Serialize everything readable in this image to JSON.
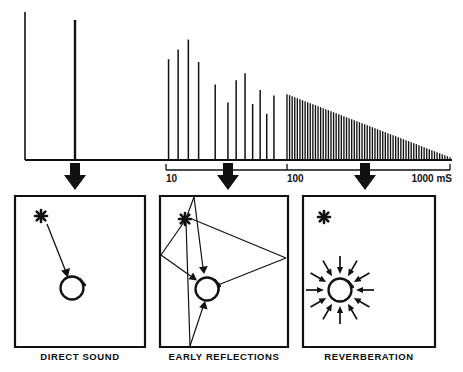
{
  "figure": {
    "background_color": "#ffffff",
    "ink_color": "#111111"
  },
  "chart_data": {
    "type": "bar",
    "title": "",
    "xlabel": "",
    "ylabel": "",
    "x_scale": "log",
    "x_unit": "mS",
    "xlim": [
      1,
      1000
    ],
    "ylim": [
      0,
      100
    ],
    "grid": false,
    "legend": null,
    "axis_ticks": [
      {
        "label": "10",
        "value": 10
      },
      {
        "label": "100",
        "value": 100
      },
      {
        "label": "1000 mS",
        "value": 1000
      }
    ],
    "unit_label": "1000 mS",
    "series": [
      {
        "name": "Direct sound",
        "values": [
          {
            "time_ms": 1.0,
            "amplitude": 100
          }
        ]
      },
      {
        "name": "Early reflections",
        "values": [
          {
            "time_ms": 10.5,
            "amplitude": 72
          },
          {
            "time_ms": 12.6,
            "amplitude": 79
          },
          {
            "time_ms": 15.3,
            "amplitude": 86
          },
          {
            "time_ms": 18.6,
            "amplitude": 70
          },
          {
            "time_ms": 25.5,
            "amplitude": 54
          },
          {
            "time_ms": 32.5,
            "amplitude": 41
          },
          {
            "time_ms": 38.0,
            "amplitude": 57
          },
          {
            "time_ms": 45.0,
            "amplitude": 62
          },
          {
            "time_ms": 52.0,
            "amplitude": 40
          },
          {
            "time_ms": 60.0,
            "amplitude": 50
          },
          {
            "time_ms": 68.0,
            "amplitude": 33
          },
          {
            "time_ms": 78.0,
            "amplitude": 46
          }
        ]
      },
      {
        "name": "Reverberation",
        "decay": "linear",
        "start_time_ms": 100,
        "end_time_ms": 1000,
        "start_amplitude": 47,
        "end_amplitude": 2,
        "pulse_count": 64
      }
    ],
    "markers": [
      {
        "label": "Direct sound marker",
        "time_ms": 1.0
      },
      {
        "label": "Early reflections marker",
        "time_ms": 25.0
      },
      {
        "label": "Reverberation marker",
        "time_ms": 270.0
      }
    ]
  },
  "panels": [
    {
      "id": "direct-sound",
      "caption": "DIRECT SOUND",
      "source_symbol": "star",
      "receiver_symbol": "circle",
      "ray_count": 1,
      "description": "One direct ray from source to listener"
    },
    {
      "id": "early-reflections",
      "caption": "EARLY REFLECTIONS",
      "source_symbol": "star",
      "receiver_symbol": "circle",
      "ray_count": 4,
      "description": "Rays bouncing off walls before reaching listener"
    },
    {
      "id": "reverberation",
      "caption": "REVERBERATION",
      "source_symbol": "star",
      "receiver_symbol": "circle",
      "ray_count": 12,
      "description": "Dense arrivals from all directions"
    }
  ]
}
